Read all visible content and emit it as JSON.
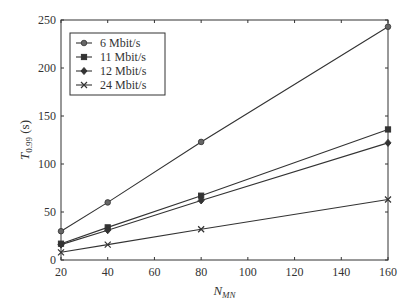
{
  "chart_data": {
    "type": "line",
    "title": "",
    "xlabel": "N_MN",
    "xlabel_main": "N",
    "xlabel_sub": "MN",
    "ylabel": "T_0.99 (s)",
    "ylabel_main": "T",
    "ylabel_sub": "0.99",
    "ylabel_unit": " (s)",
    "xlim": [
      20,
      160
    ],
    "ylim": [
      0,
      250
    ],
    "xticks": [
      20,
      40,
      60,
      80,
      100,
      120,
      140,
      160
    ],
    "yticks": [
      0,
      50,
      100,
      150,
      200,
      250
    ],
    "grid": false,
    "legend_position": "upper left",
    "x": [
      20,
      40,
      80,
      160
    ],
    "series": [
      {
        "name": "6 Mbit/s",
        "marker": "circle",
        "values": [
          30,
          60,
          123,
          243
        ]
      },
      {
        "name": "11 Mbit/s",
        "marker": "square",
        "values": [
          17,
          34,
          67,
          136
        ]
      },
      {
        "name": "12 Mbit/s",
        "marker": "diamond",
        "values": [
          16,
          31,
          62,
          122
        ]
      },
      {
        "name": "24 Mbit/s",
        "marker": "x",
        "values": [
          8,
          16,
          32,
          63
        ]
      }
    ]
  }
}
